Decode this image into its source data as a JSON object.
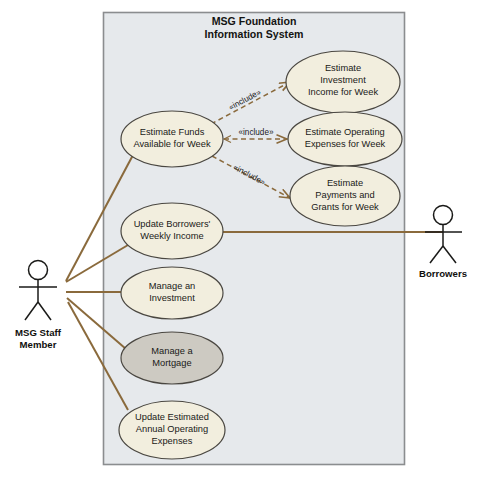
{
  "diagram": {
    "kind": "uml-use-case-diagram",
    "system": {
      "title_line1": "MSG Foundation",
      "title_line2": "Information System",
      "boundary_fill": "#e6e9ec",
      "boundary_stroke": "#8b8d8f"
    },
    "colors": {
      "usecase_fill": "#f2eede",
      "usecase_fill_highlight": "#cdcac2",
      "usecase_stroke": "#4a4741",
      "association_line": "#8a6a3c",
      "include_line": "#8a6a3c",
      "text": "#1a1a18",
      "page_background": "#ffffff"
    },
    "use_cases": [
      {
        "id": "estimate-investment-income",
        "lines": [
          "Estimate",
          "Investment",
          "Income for Week"
        ],
        "highlight": false,
        "cx": 343,
        "cy": 82,
        "rx": 57,
        "ry": 31
      },
      {
        "id": "estimate-operating-expenses",
        "lines": [
          "Estimate Operating",
          "Expenses for Week"
        ],
        "highlight": false,
        "cx": 345,
        "cy": 139,
        "rx": 57,
        "ry": 27
      },
      {
        "id": "estimate-payments-grants",
        "lines": [
          "Estimate",
          "Payments and",
          "Grants for Week"
        ],
        "highlight": false,
        "cx": 345,
        "cy": 196,
        "rx": 55,
        "ry": 30
      },
      {
        "id": "estimate-funds-available",
        "lines": [
          "Estimate Funds",
          "Available for Week"
        ],
        "highlight": false,
        "cx": 172,
        "cy": 139,
        "rx": 51,
        "ry": 28
      },
      {
        "id": "update-borrowers-weekly-income",
        "lines": [
          "Update Borrowers'",
          "Weekly Income"
        ],
        "highlight": false,
        "cx": 172,
        "cy": 231,
        "rx": 51,
        "ry": 28
      },
      {
        "id": "manage-an-investment",
        "lines": [
          "Manage an",
          "Investment"
        ],
        "highlight": false,
        "cx": 172,
        "cy": 293,
        "rx": 51,
        "ry": 26
      },
      {
        "id": "manage-a-mortgage",
        "lines": [
          "Manage a",
          "Mortgage"
        ],
        "highlight": true,
        "cx": 172,
        "cy": 358,
        "rx": 51,
        "ry": 26
      },
      {
        "id": "update-estimated-annual-operating-expenses",
        "lines": [
          "Update Estimated",
          "Annual Operating",
          "Expenses"
        ],
        "highlight": false,
        "cx": 172,
        "cy": 430,
        "rx": 53,
        "ry": 29
      }
    ],
    "actors": [
      {
        "id": "msg-staff-member",
        "lines": [
          "MSG Staff",
          "Member"
        ],
        "x": 38,
        "y": 262
      },
      {
        "id": "borrowers",
        "lines": [
          "Borrowers"
        ],
        "x": 443,
        "y": 205
      }
    ],
    "include_relations": [
      {
        "id": "include-investment-income",
        "label": "«include»"
      },
      {
        "id": "include-operating-expenses",
        "label": "«include»"
      },
      {
        "id": "include-payments-grants",
        "label": "«include»"
      }
    ]
  }
}
